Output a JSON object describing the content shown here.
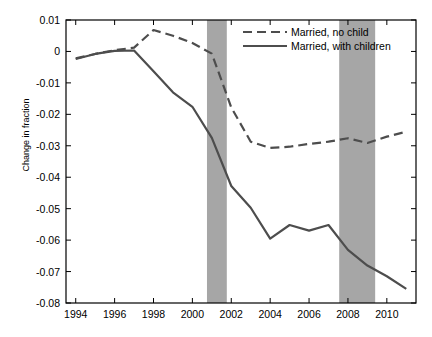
{
  "chart_data": {
    "type": "line",
    "title": "",
    "xlabel": "",
    "ylabel": "Change in fraction",
    "xlim": [
      1993.5,
      2011.5
    ],
    "ylim": [
      -0.08,
      0.01
    ],
    "xticks": [
      "1994",
      "1996",
      "1998",
      "2000",
      "2002",
      "2004",
      "2006",
      "2008",
      "2010"
    ],
    "xtick_values": [
      1994,
      1996,
      1998,
      2000,
      2002,
      2004,
      2006,
      2008,
      2010
    ],
    "yticks": [
      "0.01",
      "0",
      "-0.01",
      "-0.02",
      "-0.03",
      "-0.04",
      "-0.05",
      "-0.06",
      "-0.07",
      "-0.08"
    ],
    "ytick_values": [
      0.01,
      0,
      -0.01,
      -0.02,
      -0.03,
      -0.04,
      -0.05,
      -0.06,
      -0.07,
      -0.08
    ],
    "grid": false,
    "legend_position": "top-right",
    "x": [
      1994,
      1995,
      1996,
      1997,
      1998,
      1999,
      2000,
      2001,
      2002,
      2003,
      2004,
      2005,
      2006,
      2007,
      2008,
      2009,
      2010,
      2011
    ],
    "series": [
      {
        "name": "Married, no child",
        "style": "dashed",
        "color": "#4d4d4d",
        "values": [
          -0.0022,
          -0.0008,
          0.0004,
          0.0012,
          0.0068,
          0.005,
          0.0027,
          -0.0007,
          -0.0178,
          -0.0287,
          -0.0307,
          -0.0303,
          -0.0294,
          -0.0287,
          -0.0276,
          -0.0291,
          -0.0271,
          -0.0255
        ]
      },
      {
        "name": "Married, with children",
        "style": "solid",
        "color": "#4d4d4d",
        "values": [
          -0.0024,
          -0.0008,
          0.0002,
          0.0003,
          -0.0063,
          -0.013,
          -0.0176,
          -0.0275,
          -0.0428,
          -0.0497,
          -0.0595,
          -0.0552,
          -0.057,
          -0.0552,
          -0.0631,
          -0.0681,
          -0.0715,
          -0.0755
        ]
      }
    ],
    "recession_bands": [
      {
        "start": 2000.75,
        "end": 2001.77,
        "color": "#a6a6a6"
      },
      {
        "start": 2007.55,
        "end": 2009.4,
        "color": "#a6a6a6"
      }
    ],
    "axis_color": "#000000",
    "background_color": "#ffffff"
  },
  "legend": {
    "entries": [
      {
        "label": "Married, no child",
        "style": "dashed"
      },
      {
        "label": "Married, with children",
        "style": "solid"
      }
    ]
  }
}
